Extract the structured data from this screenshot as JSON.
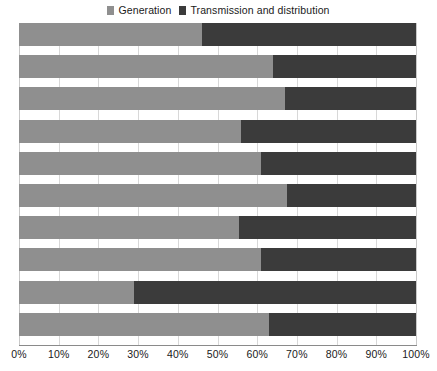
{
  "chart_data": {
    "type": "bar",
    "orientation": "horizontal",
    "stacked": true,
    "normalized": true,
    "title": "",
    "subtitle": "",
    "xlabel": "",
    "ylabel": "",
    "xlim": [
      0,
      100
    ],
    "xtick_labels": [
      "0%",
      "10%",
      "20%",
      "30%",
      "40%",
      "50%",
      "60%",
      "70%",
      "80%",
      "90%",
      "100%"
    ],
    "xtick_values": [
      0,
      10,
      20,
      30,
      40,
      50,
      60,
      70,
      80,
      90,
      100
    ],
    "grid": true,
    "grid_axis": "x",
    "legend_position": "top-center",
    "categories": [
      "",
      "",
      "",
      "",
      "",
      "",
      "",
      "",
      "",
      ""
    ],
    "series": [
      {
        "name": "Generation",
        "color": "#8f8f8f",
        "values": [
          46,
          64,
          67,
          56,
          61,
          67.5,
          55.5,
          61,
          29,
          63
        ]
      },
      {
        "name": "Transmission and distribution",
        "color": "#3b3b3b",
        "values": [
          54,
          36,
          33,
          44,
          39,
          32.5,
          44.5,
          39,
          71,
          37
        ]
      }
    ]
  },
  "legend": {
    "entries": [
      {
        "label": "Generation",
        "icon": "square-swatch-icon"
      },
      {
        "label": "Transmission and distribution",
        "icon": "square-swatch-icon"
      }
    ]
  }
}
